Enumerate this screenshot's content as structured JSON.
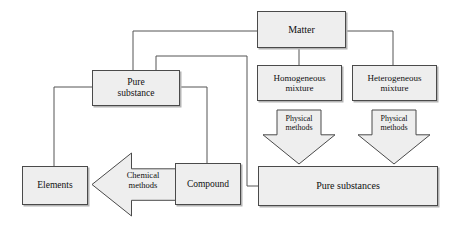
{
  "diagram": {
    "colors": {
      "node_fill": "#eeeeee",
      "node_stroke": "#4a4a4a",
      "arrow_fill": "#eeeeee",
      "arrow_stroke": "#4a4a4a",
      "edge_stroke": "#555555",
      "background": "#ffffff",
      "text": "#101010"
    },
    "nodes": [
      {
        "id": "matter",
        "label": "Matter",
        "x": 257,
        "y": 11,
        "w": 89,
        "h": 37,
        "font_size": 10
      },
      {
        "id": "pure_substance",
        "label": "Pure\nsubstance",
        "x": 92,
        "y": 70,
        "w": 88,
        "h": 36,
        "font_size": 9.5
      },
      {
        "id": "homogeneous",
        "label": "Homogeneous\nmixture",
        "x": 257,
        "y": 65,
        "w": 85,
        "h": 36,
        "font_size": 9
      },
      {
        "id": "heterogeneous",
        "label": "Heterogeneous\nmixture",
        "x": 352,
        "y": 65,
        "w": 85,
        "h": 36,
        "font_size": 9
      },
      {
        "id": "elements",
        "label": "Elements",
        "x": 22,
        "y": 166,
        "w": 66,
        "h": 39,
        "font_size": 9.5
      },
      {
        "id": "compound",
        "label": "Compound",
        "x": 175,
        "y": 163,
        "w": 66,
        "h": 42,
        "font_size": 9.5
      },
      {
        "id": "pure_substances",
        "label": "Pure  substances",
        "x": 258,
        "y": 166,
        "w": 180,
        "h": 40,
        "font_size": 10
      }
    ],
    "arrows": [
      {
        "id": "physical_methods_left",
        "label": "Physical\nmethods",
        "direction": "down",
        "x": 263,
        "y": 110,
        "w": 72,
        "h": 54,
        "font_size": 8,
        "label_x": 272,
        "label_y": 115,
        "label_w": 54
      },
      {
        "id": "physical_methods_right",
        "label": "Physical\nmethods",
        "direction": "down",
        "x": 358,
        "y": 110,
        "w": 72,
        "h": 54,
        "font_size": 8,
        "label_x": 367,
        "label_y": 115,
        "label_w": 54
      },
      {
        "id": "chemical_methods",
        "label": "Chemical\nmethods",
        "direction": "left",
        "x": 92,
        "y": 153,
        "w": 84,
        "h": 63,
        "font_size": 8.5,
        "label_x": 114,
        "label_y": 171,
        "label_w": 58
      }
    ],
    "edges": [
      {
        "id": "matter-to-pure-substance",
        "points": "133,70 133,31 257,31"
      },
      {
        "id": "matter-to-homogeneous",
        "points": "299,48 299,65"
      },
      {
        "id": "matter-to-heterogeneous",
        "points": "346,31 393,31 393,65"
      },
      {
        "id": "pure-substance-to-elements",
        "points": "92,87 54,87 54,166"
      },
      {
        "id": "pure-substance-to-compound",
        "points": "180,87 207,87 207,163"
      },
      {
        "id": "pure-substances-to-pure-substance",
        "points": "156,70 156,56 247,56 247,186 258,186"
      }
    ]
  }
}
